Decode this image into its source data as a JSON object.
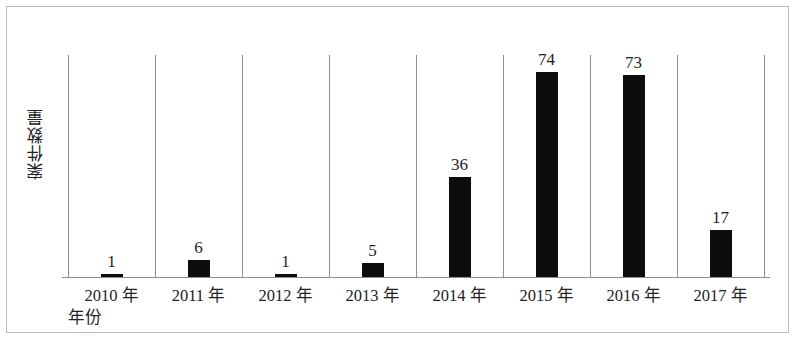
{
  "chart_data": {
    "type": "bar",
    "title": "",
    "subtitle": "",
    "xlabel": "年份",
    "ylabel": "案件数量",
    "categories": [
      "2010 年",
      "2011 年",
      "2012 年",
      "2013 年",
      "2014 年",
      "2015 年",
      "2016 年",
      "2017 年"
    ],
    "values": [
      1,
      6,
      1,
      5,
      36,
      74,
      73,
      17
    ],
    "data_labels": [
      "1",
      "6",
      "1",
      "5",
      "36",
      "74",
      "73",
      "17"
    ],
    "series": [
      {
        "name": "案件数量",
        "values": [
          1,
          6,
          1,
          5,
          36,
          74,
          73,
          17
        ]
      }
    ],
    "ylim": [
      0,
      80
    ],
    "yticks": [],
    "ytick_labels": [],
    "grid": "vertical-category-separators",
    "legend": "none",
    "bar_color": "#0d0d0d",
    "axis_color": "#8e8e8e",
    "frame_color": "#b9b9b9",
    "background": "#ffffff"
  }
}
